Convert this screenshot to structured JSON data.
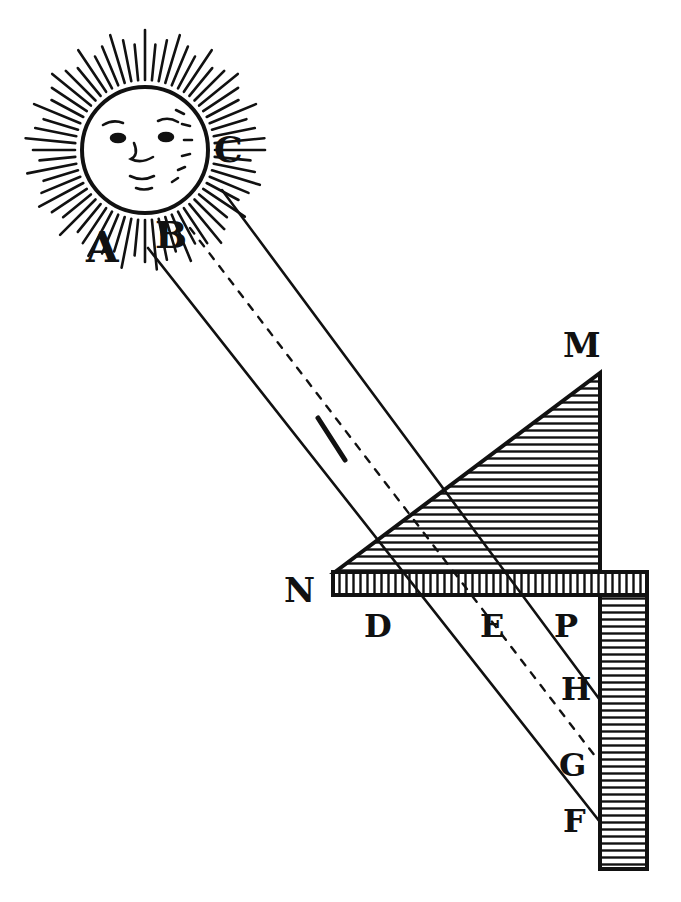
{
  "figure": {
    "ink_color": "#111111",
    "paper_color": "#ffffff"
  },
  "sun": {
    "labels": [
      "A",
      "B",
      "C"
    ]
  },
  "instrument": {
    "apex_label": "M",
    "corner_label": "N",
    "horizontal_labels": [
      "D",
      "E",
      "P"
    ],
    "vertical_labels": [
      "H",
      "G",
      "F"
    ]
  }
}
